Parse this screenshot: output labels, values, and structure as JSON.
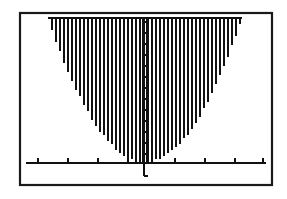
{
  "figure": {
    "kind": "graphing-calculator-plot",
    "background_color": "#ffffff",
    "ink_color": "#111111",
    "frame": {
      "x": 20,
      "y": 13,
      "width": 252,
      "height": 172,
      "stroke_color": "#1a1a1a",
      "stroke_width": 2.2
    }
  },
  "chart_data": {
    "type": "area",
    "title": "",
    "subtitle": "",
    "xlabel": "",
    "ylabel": "",
    "grid": false,
    "legend": null,
    "annotations": [],
    "function": "y = a*(x - h)^2 + k",
    "vertex": [
      0,
      0
    ],
    "opens": "up",
    "shading": {
      "style": "vertical-hatch",
      "region": "between curve and top of window",
      "line_spacing_px": 4,
      "line_count": 49,
      "color": "#111111"
    },
    "axes": {
      "x_axis": {
        "visible": true,
        "pixel_y": 163,
        "pixel_x_start": 26,
        "pixel_x_end": 266,
        "tick_pixels": [
          38,
          68,
          98,
          128,
          175,
          205,
          235,
          263
        ],
        "tick_labels": [],
        "tick_length_px": 5
      },
      "y_axis": {
        "visible": true,
        "pixel_x": 145,
        "pixel_y_top": 18,
        "pixel_y_bottom": 176,
        "style": "double-rail-with-ticks",
        "rail_offset_px": 4,
        "tick_count": 13,
        "tick_spacing_px": 11,
        "tick_labels": []
      }
    },
    "xlim": [
      -4,
      4
    ],
    "ylim": [
      0,
      10
    ],
    "curve_points_px": [
      [
        48,
        18
      ],
      [
        56,
        30
      ],
      [
        64,
        45
      ],
      [
        72,
        60
      ],
      [
        80,
        76
      ],
      [
        88,
        92
      ],
      [
        96,
        106
      ],
      [
        104,
        120
      ],
      [
        112,
        133
      ],
      [
        120,
        144
      ],
      [
        128,
        153
      ],
      [
        136,
        159
      ],
      [
        145,
        162
      ],
      [
        154,
        159
      ],
      [
        162,
        153
      ],
      [
        170,
        144
      ],
      [
        178,
        133
      ],
      [
        186,
        120
      ],
      [
        194,
        106
      ],
      [
        202,
        92
      ],
      [
        210,
        76
      ],
      [
        218,
        60
      ],
      [
        226,
        45
      ],
      [
        234,
        30
      ],
      [
        242,
        18
      ]
    ]
  }
}
